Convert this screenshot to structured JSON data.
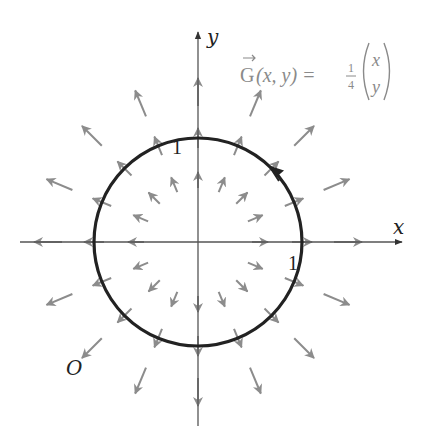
{
  "figure": {
    "axes": {
      "x_label": "x",
      "y_label": "y",
      "origin": {
        "cx": 198,
        "cy": 242
      },
      "x_extent": [
        20,
        405
      ],
      "y_extent": [
        30,
        426
      ]
    },
    "circle": {
      "radius_px": 104,
      "orientation": "counterclockwise",
      "color": "#222222"
    },
    "tick_labels": {
      "top": "1",
      "right": "1"
    },
    "region_label": "O",
    "formula": {
      "lhs": "G",
      "args": "(x, y) =",
      "frac_num": "1",
      "frac_den": "4",
      "vec_top": "x",
      "vec_bottom": "y"
    },
    "field": {
      "color": "#8c8c8c",
      "rings": [
        {
          "r": 62,
          "len": 16
        },
        {
          "r": 104,
          "len": 20
        },
        {
          "r": 150,
          "len": 28
        }
      ],
      "directions": 16
    }
  }
}
